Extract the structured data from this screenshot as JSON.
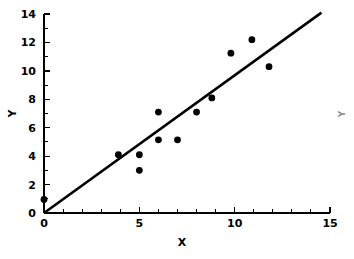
{
  "chart_data": {
    "type": "scatter",
    "title": "",
    "xlabel": "X",
    "ylabel": "Y",
    "xlim": [
      0,
      15
    ],
    "ylim": [
      0,
      14
    ],
    "grid": false,
    "legend": null,
    "x_ticks": [
      0,
      5,
      10,
      15
    ],
    "x_tick_labels": [
      "0",
      "5",
      "10",
      "15"
    ],
    "x_minor_ticks": [
      1,
      2,
      3,
      4,
      6,
      7,
      8,
      9,
      11,
      12,
      13,
      14
    ],
    "y_ticks": [
      0,
      2,
      4,
      6,
      8,
      10,
      12,
      14
    ],
    "y_tick_labels": [
      "0",
      "2",
      "4",
      "6",
      "8",
      "10",
      "12",
      "14"
    ],
    "y_minor_ticks": [
      1,
      3,
      5,
      7,
      9,
      11,
      13
    ],
    "points": [
      {
        "x": 0.0,
        "y": 0.95
      },
      {
        "x": 3.9,
        "y": 4.1
      },
      {
        "x": 5.0,
        "y": 4.1
      },
      {
        "x": 5.0,
        "y": 3.0
      },
      {
        "x": 6.0,
        "y": 7.1
      },
      {
        "x": 6.0,
        "y": 5.15
      },
      {
        "x": 7.0,
        "y": 5.15
      },
      {
        "x": 8.0,
        "y": 7.1
      },
      {
        "x": 8.8,
        "y": 8.1
      },
      {
        "x": 9.8,
        "y": 11.25
      },
      {
        "x": 10.9,
        "y": 12.2
      },
      {
        "x": 11.8,
        "y": 10.3
      }
    ],
    "fit_line": {
      "kind": "line-through-origin",
      "x_start": 0,
      "y_start": 0,
      "x_end": 14.55,
      "y_end": 14.1,
      "slope": 0.97,
      "intercept": 0
    },
    "edge_label": "Y",
    "colors": {
      "point": "#000000",
      "line": "#000000",
      "axis": "#000000",
      "background": "#ffffff",
      "edge_label": "#8a8a8a"
    }
  }
}
